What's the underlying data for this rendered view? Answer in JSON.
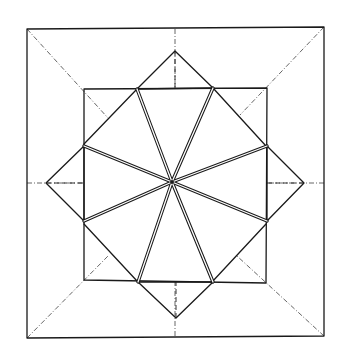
{
  "diagram": {
    "type": "origami-crease-pattern",
    "colors": {
      "line": "#1a1a1a",
      "crease": "#555555",
      "background": "#ffffff"
    },
    "outer_square": [
      [
        27,
        29
      ],
      [
        324,
        27
      ],
      [
        324,
        336
      ],
      [
        27,
        338
      ]
    ],
    "inner_square": [
      [
        84,
        89
      ],
      [
        267,
        88
      ],
      [
        266,
        283
      ],
      [
        84,
        280
      ]
    ],
    "center": [
      172,
      182
    ],
    "kites": [
      {
        "name": "top",
        "tip": [
          175,
          51
        ],
        "base": [
          [
            137,
            89
          ],
          [
            213,
            88
          ]
        ]
      },
      {
        "name": "right",
        "tip": [
          304,
          183
        ],
        "base": [
          [
            267,
            146
          ],
          [
            267,
            221
          ]
        ]
      },
      {
        "name": "bottom",
        "tip": [
          176,
          318
        ],
        "base": [
          [
            138,
            282
          ],
          [
            213,
            282
          ]
        ]
      },
      {
        "name": "left",
        "tip": [
          46,
          183
        ],
        "base": [
          [
            84,
            146
          ],
          [
            84,
            221
          ]
        ]
      }
    ],
    "corner_folds": [
      [
        [
          137,
          89
        ],
        [
          84,
          144
        ]
      ],
      [
        [
          213,
          88
        ],
        [
          266,
          146
        ]
      ],
      [
        [
          266,
          224
        ],
        [
          212,
          282
        ]
      ],
      [
        [
          84,
          224
        ],
        [
          137,
          281
        ]
      ]
    ],
    "spokes": [
      [
        137,
        89
      ],
      [
        213,
        88
      ],
      [
        267,
        146
      ],
      [
        267,
        221
      ],
      [
        213,
        282
      ],
      [
        138,
        282
      ],
      [
        84,
        221
      ],
      [
        84,
        146
      ]
    ],
    "corner_creases": [
      [
        [
          27,
          29
        ],
        [
          108,
          118
        ]
      ],
      [
        [
          324,
          27
        ],
        [
          240,
          115
        ]
      ],
      [
        [
          324,
          336
        ],
        [
          237,
          256
        ]
      ],
      [
        [
          27,
          338
        ],
        [
          108,
          256
        ]
      ]
    ],
    "center_creases": [
      [
        [
          175,
          29
        ],
        [
          175,
          89
        ]
      ],
      [
        [
          324,
          183
        ],
        [
          267,
          183
        ]
      ],
      [
        [
          175,
          336
        ],
        [
          175,
          282
        ]
      ],
      [
        [
          27,
          183
        ],
        [
          84,
          183
        ]
      ]
    ],
    "kite_axes": [
      [
        [
          175,
          51
        ],
        [
          175,
          89
        ]
      ],
      [
        [
          304,
          183
        ],
        [
          267,
          183
        ]
      ],
      [
        [
          176,
          318
        ],
        [
          176,
          282
        ]
      ],
      [
        [
          46,
          183
        ],
        [
          84,
          183
        ]
      ]
    ]
  }
}
